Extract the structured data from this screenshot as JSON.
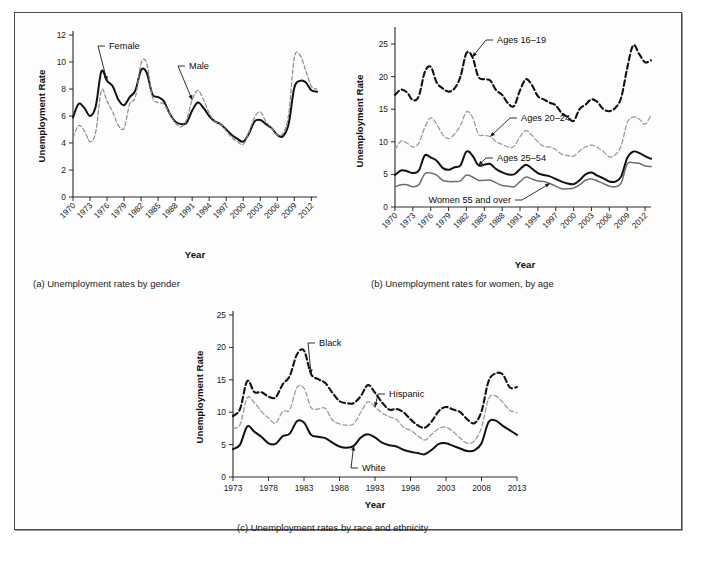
{
  "figure": {
    "panels": [
      {
        "id": "a",
        "caption": "(a) Unemployment rates by gender",
        "y_axis_title": "Unemployment Rate",
        "x_axis_title": "Year"
      },
      {
        "id": "b",
        "caption": "(b) Unemployment rates for women, by age",
        "y_axis_title": "Unemployment Rate",
        "x_axis_title": "Year"
      },
      {
        "id": "c",
        "caption": "(c) Unemployment rates by race and ethnicity",
        "y_axis_title": "Unemployment Rate",
        "x_axis_title": "Year"
      }
    ]
  },
  "chart_data": [
    {
      "panel": "a",
      "type": "line",
      "title": "(a) Unemployment rates by gender",
      "xlabel": "Year",
      "ylabel": "Unemployment Rate",
      "xlim": [
        1970,
        2013
      ],
      "ylim": [
        0,
        12
      ],
      "yticks": [
        0,
        2,
        4,
        6,
        8,
        10,
        12
      ],
      "xticks": [
        1970,
        1973,
        1976,
        1979,
        1982,
        1985,
        1988,
        1991,
        1994,
        1997,
        2000,
        2003,
        2006,
        2009,
        2012
      ],
      "grid": false,
      "legend": "inline-annotations",
      "x": [
        1970,
        1971,
        1972,
        1973,
        1974,
        1975,
        1976,
        1977,
        1978,
        1979,
        1980,
        1981,
        1982,
        1983,
        1984,
        1985,
        1986,
        1987,
        1988,
        1989,
        1990,
        1991,
        1992,
        1993,
        1994,
        1995,
        1996,
        1997,
        1998,
        1999,
        2000,
        2001,
        2002,
        2003,
        2004,
        2005,
        2006,
        2007,
        2008,
        2009,
        2010,
        2011,
        2012,
        2013
      ],
      "series": [
        {
          "name": "Female",
          "style": "solid-black",
          "label_anchor_year": 1976,
          "values": [
            5.9,
            6.9,
            6.6,
            6.0,
            6.7,
            9.3,
            8.6,
            8.2,
            7.2,
            6.8,
            7.4,
            7.9,
            9.4,
            9.2,
            7.6,
            7.4,
            7.1,
            6.2,
            5.6,
            5.4,
            5.5,
            6.4,
            7.0,
            6.6,
            6.0,
            5.6,
            5.4,
            5.0,
            4.6,
            4.3,
            4.1,
            4.7,
            5.6,
            5.7,
            5.4,
            5.1,
            4.6,
            4.5,
            5.4,
            8.1,
            8.6,
            8.5,
            7.9,
            7.8
          ]
        },
        {
          "name": "Male",
          "style": "dashed-gray",
          "label_anchor_year": 1991,
          "values": [
            4.4,
            5.3,
            4.9,
            4.1,
            4.8,
            7.9,
            7.1,
            6.3,
            5.3,
            5.1,
            6.9,
            7.4,
            9.9,
            9.9,
            7.4,
            7.0,
            6.9,
            6.2,
            5.5,
            5.2,
            5.7,
            7.2,
            7.9,
            7.2,
            6.2,
            5.6,
            5.4,
            4.9,
            4.4,
            4.1,
            3.9,
            4.8,
            5.9,
            6.3,
            5.6,
            5.1,
            4.6,
            4.7,
            6.1,
            10.3,
            10.5,
            9.4,
            8.2,
            8.0
          ]
        }
      ]
    },
    {
      "panel": "b",
      "type": "line",
      "title": "(b) Unemployment rates for women, by age",
      "xlabel": "Year",
      "ylabel": "Unemployment Rate",
      "xlim": [
        1970,
        2013
      ],
      "ylim": [
        0,
        27
      ],
      "yticks": [
        0,
        5,
        10,
        15,
        20,
        25
      ],
      "xticks": [
        1970,
        1973,
        1976,
        1979,
        1982,
        1985,
        1988,
        1991,
        1994,
        1997,
        2000,
        2003,
        2006,
        2009,
        2012
      ],
      "grid": false,
      "legend": "inline-annotations",
      "x": [
        1970,
        1971,
        1972,
        1973,
        1974,
        1975,
        1976,
        1977,
        1978,
        1979,
        1980,
        1981,
        1982,
        1983,
        1984,
        1985,
        1986,
        1987,
        1988,
        1989,
        1990,
        1991,
        1992,
        1993,
        1994,
        1995,
        1996,
        1997,
        1998,
        1999,
        2000,
        2001,
        2002,
        2003,
        2004,
        2005,
        2006,
        2007,
        2008,
        2009,
        2010,
        2011,
        2012,
        2013
      ],
      "series": [
        {
          "name": "Ages 16–19",
          "style": "dashed-black-heavy",
          "label_anchor_year": 1983,
          "values": [
            17.2,
            18.0,
            17.6,
            16.4,
            17.0,
            20.7,
            21.5,
            19.1,
            18.2,
            17.7,
            18.2,
            20.0,
            23.6,
            23.0,
            20.0,
            19.6,
            19.4,
            17.9,
            17.2,
            15.9,
            15.5,
            17.9,
            19.6,
            18.7,
            17.0,
            16.5,
            16.0,
            15.6,
            14.4,
            13.8,
            13.2,
            15.0,
            15.7,
            16.5,
            16.1,
            15.0,
            14.7,
            15.2,
            16.8,
            21.3,
            24.8,
            23.5,
            22.2,
            22.5
          ]
        },
        {
          "name": "Ages 20–24",
          "style": "dashed-gray-light",
          "label_anchor_year": 1986,
          "values": [
            8.8,
            10.1,
            9.8,
            9.2,
            9.8,
            12.2,
            13.7,
            12.7,
            11.1,
            10.5,
            11.2,
            12.5,
            14.6,
            13.8,
            11.2,
            11.0,
            10.8,
            10.0,
            9.6,
            9.2,
            9.3,
            10.8,
            11.7,
            11.0,
            10.0,
            9.3,
            9.2,
            8.8,
            8.1,
            7.9,
            7.8,
            8.6,
            9.2,
            9.5,
            9.1,
            8.5,
            7.7,
            8.0,
            9.4,
            12.9,
            13.8,
            13.5,
            12.7,
            14.1
          ]
        },
        {
          "name": "Ages 25–54",
          "style": "solid-black",
          "label_anchor_year": 1984,
          "values": [
            4.9,
            5.6,
            5.5,
            5.2,
            5.6,
            7.9,
            7.6,
            7.1,
            6.0,
            5.7,
            6.1,
            6.4,
            8.5,
            7.9,
            6.4,
            6.5,
            6.6,
            5.8,
            5.3,
            5.0,
            5.0,
            5.8,
            6.5,
            5.9,
            5.2,
            4.9,
            4.7,
            4.3,
            3.9,
            3.6,
            3.5,
            4.1,
            5.0,
            5.3,
            4.8,
            4.4,
            3.9,
            3.9,
            4.7,
            7.5,
            8.5,
            8.3,
            7.8,
            7.4
          ]
        },
        {
          "name": "Women 55 and over",
          "style": "solid-gray",
          "label_anchor_year": 1996,
          "values": [
            3.1,
            3.4,
            3.4,
            3.1,
            3.4,
            5.1,
            5.2,
            4.9,
            4.1,
            3.9,
            3.9,
            4.0,
            4.9,
            4.6,
            4.1,
            4.1,
            4.1,
            3.7,
            3.3,
            3.2,
            3.1,
            3.9,
            4.6,
            4.3,
            4.0,
            3.9,
            3.6,
            3.2,
            2.8,
            2.8,
            2.9,
            3.4,
            4.1,
            4.3,
            4.0,
            3.6,
            3.2,
            3.1,
            3.7,
            6.6,
            6.8,
            6.7,
            6.3,
            6.2
          ]
        }
      ]
    },
    {
      "panel": "c",
      "type": "line",
      "title": "(c) Unemployment rates by race and ethnicity",
      "xlabel": "Year",
      "ylabel": "Unemployment Rate",
      "xlim": [
        1973,
        2013
      ],
      "ylim": [
        0,
        25
      ],
      "yticks": [
        0,
        5,
        10,
        15,
        20,
        25
      ],
      "xticks": [
        1973,
        1978,
        1983,
        1988,
        1993,
        1998,
        2003,
        2008,
        2013
      ],
      "grid": false,
      "legend": "inline-annotations",
      "x": [
        1973,
        1974,
        1975,
        1976,
        1977,
        1978,
        1979,
        1980,
        1981,
        1982,
        1983,
        1984,
        1985,
        1986,
        1987,
        1988,
        1989,
        1990,
        1991,
        1992,
        1993,
        1994,
        1995,
        1996,
        1997,
        1998,
        1999,
        2000,
        2001,
        2002,
        2003,
        2004,
        2005,
        2006,
        2007,
        2008,
        2009,
        2010,
        2011,
        2012,
        2013
      ],
      "series": [
        {
          "name": "Black",
          "style": "dashed-black-heavy",
          "label_anchor_year": 1984,
          "values": [
            9.4,
            10.5,
            14.8,
            13.1,
            13.1,
            12.4,
            12.3,
            14.3,
            15.6,
            18.9,
            19.5,
            15.9,
            15.1,
            14.5,
            13.0,
            11.7,
            11.4,
            11.4,
            12.5,
            14.2,
            13.0,
            11.5,
            10.4,
            10.5,
            10.0,
            8.9,
            8.0,
            7.6,
            8.6,
            10.2,
            10.8,
            10.4,
            10.0,
            8.9,
            8.3,
            10.1,
            14.8,
            16.0,
            15.8,
            13.8,
            13.9
          ]
        },
        {
          "name": "Hispanic",
          "style": "dashed-gray-light",
          "label_anchor_year": 1993,
          "values": [
            7.5,
            8.1,
            12.2,
            11.5,
            10.1,
            9.1,
            8.3,
            10.1,
            10.4,
            13.8,
            13.7,
            10.7,
            10.5,
            10.6,
            8.8,
            8.2,
            8.0,
            8.2,
            10.0,
            11.6,
            10.8,
            9.9,
            9.3,
            8.9,
            7.7,
            7.2,
            6.4,
            5.7,
            6.6,
            7.5,
            7.7,
            7.0,
            6.0,
            5.2,
            5.6,
            7.6,
            12.1,
            12.5,
            11.5,
            10.3,
            9.9
          ]
        },
        {
          "name": "White",
          "style": "solid-black",
          "label_anchor_year": 1990,
          "values": [
            4.3,
            5.0,
            7.8,
            7.0,
            6.2,
            5.2,
            5.1,
            6.3,
            6.7,
            8.6,
            8.4,
            6.5,
            6.2,
            6.0,
            5.3,
            4.7,
            4.5,
            4.8,
            6.1,
            6.6,
            6.1,
            5.3,
            4.9,
            4.7,
            4.2,
            3.9,
            3.7,
            3.5,
            4.2,
            5.1,
            5.2,
            4.8,
            4.4,
            4.0,
            4.1,
            5.2,
            8.5,
            8.7,
            7.9,
            7.2,
            6.5
          ]
        }
      ]
    }
  ]
}
